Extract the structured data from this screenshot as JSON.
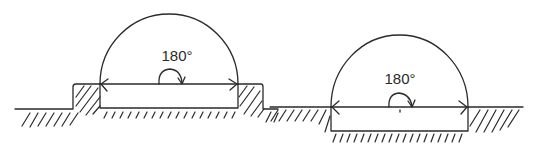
{
  "figures": [
    {
      "id": "raised",
      "description": "Plate on raised ground with 180 degree swing arc",
      "angle_label": "180°"
    },
    {
      "id": "recessed",
      "description": "Plate recessed into ground with 180 degree swing arc",
      "angle_label": "180°"
    }
  ],
  "colors": {
    "line": "#2a2a2a",
    "background": "#ffffff"
  }
}
